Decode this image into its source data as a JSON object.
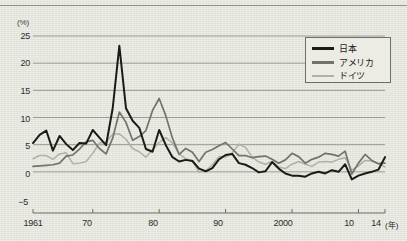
{
  "axes": {
    "y_unit_label": "(%)",
    "y_ticks": [
      "25",
      "20",
      "15",
      "10",
      "5",
      "0",
      "−5"
    ],
    "x_ticks": [
      "1961",
      "70",
      "80",
      "90",
      "2000",
      "10",
      "14"
    ],
    "x_unit_label": "(年)"
  },
  "legend": {
    "position": "top-right",
    "items": [
      {
        "label": "日本",
        "color": "#1a1a17"
      },
      {
        "label": "アメリカ",
        "color": "#72736a"
      },
      {
        "label": "ドイツ",
        "color": "#b0b0a5"
      }
    ]
  },
  "colors": {
    "background": "#e6e6de",
    "gridline": "#9a9b90",
    "axis": "#6e6f66",
    "japan": "#1a1a17",
    "america": "#72736a",
    "germany": "#b0b0a5",
    "text": "#2c2c28"
  },
  "chart_data": {
    "type": "line",
    "title": "",
    "subtitle": "",
    "xlabel": "(年)",
    "ylabel": "(%)",
    "xlim": [
      1961,
      2014
    ],
    "ylim": [
      -5,
      25
    ],
    "ytick_values": [
      25,
      20,
      15,
      10,
      5,
      0,
      -5
    ],
    "xtick_values": [
      1961,
      1970,
      1980,
      1990,
      2000,
      2010,
      2014
    ],
    "grid": true,
    "legend_position": "top-right",
    "x": [
      1961,
      1962,
      1963,
      1964,
      1965,
      1966,
      1967,
      1968,
      1969,
      1970,
      1971,
      1972,
      1973,
      1974,
      1975,
      1976,
      1977,
      1978,
      1979,
      1980,
      1981,
      1982,
      1983,
      1984,
      1985,
      1986,
      1987,
      1988,
      1989,
      1990,
      1991,
      1992,
      1993,
      1994,
      1995,
      1996,
      1997,
      1998,
      1999,
      2000,
      2001,
      2002,
      2003,
      2004,
      2005,
      2006,
      2007,
      2008,
      2009,
      2010,
      2011,
      2012,
      2013,
      2014
    ],
    "series": [
      {
        "name": "日本",
        "color": "#1a1a17",
        "values": [
          5.3,
          6.8,
          7.6,
          3.9,
          6.6,
          5.1,
          4.0,
          5.3,
          5.2,
          7.7,
          6.3,
          4.9,
          11.7,
          23.2,
          11.7,
          9.4,
          8.1,
          4.2,
          3.7,
          7.7,
          4.9,
          2.7,
          1.9,
          2.2,
          2.0,
          0.6,
          0.1,
          0.7,
          2.3,
          3.1,
          3.3,
          1.6,
          1.3,
          0.7,
          -0.1,
          0.1,
          1.8,
          0.6,
          -0.3,
          -0.7,
          -0.7,
          -0.9,
          -0.3,
          0.0,
          -0.3,
          0.3,
          0.0,
          1.4,
          -1.4,
          -0.7,
          -0.3,
          0.0,
          0.4,
          2.7
        ]
      },
      {
        "name": "アメリカ",
        "color": "#72736a",
        "values": [
          1.0,
          1.1,
          1.2,
          1.3,
          1.6,
          2.9,
          3.1,
          4.2,
          5.5,
          5.8,
          4.3,
          3.3,
          6.2,
          11.0,
          9.1,
          5.8,
          6.5,
          7.6,
          11.3,
          13.5,
          10.3,
          6.2,
          3.2,
          4.3,
          3.6,
          1.9,
          3.6,
          4.1,
          4.8,
          5.4,
          4.2,
          3.0,
          3.0,
          2.6,
          2.8,
          2.9,
          2.3,
          1.6,
          2.2,
          3.4,
          2.8,
          1.6,
          2.3,
          2.7,
          3.4,
          3.2,
          2.9,
          3.8,
          -0.4,
          1.6,
          3.2,
          2.1,
          1.5,
          1.6
        ]
      },
      {
        "name": "ドイツ",
        "color": "#b0b0a5",
        "values": [
          2.4,
          3.0,
          3.0,
          2.3,
          3.3,
          3.5,
          1.5,
          1.6,
          1.9,
          3.4,
          5.3,
          5.5,
          6.9,
          7.0,
          6.0,
          4.3,
          3.7,
          2.7,
          4.1,
          5.4,
          6.3,
          5.3,
          3.3,
          2.4,
          2.1,
          -0.1,
          0.2,
          1.3,
          2.8,
          2.7,
          3.5,
          5.1,
          4.5,
          2.7,
          1.8,
          1.4,
          1.9,
          0.9,
          0.6,
          1.4,
          1.9,
          1.4,
          1.0,
          1.8,
          1.9,
          1.8,
          2.3,
          2.6,
          0.3,
          1.1,
          2.1,
          2.0,
          1.5,
          0.9
        ]
      }
    ]
  }
}
